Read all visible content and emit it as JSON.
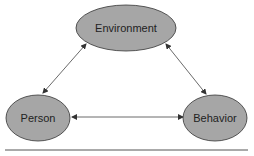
{
  "diagram": {
    "type": "triadic-reciprocal-causation",
    "nodes": [
      {
        "id": "environment",
        "label": "Environment",
        "cx": 126,
        "cy": 28,
        "rx": 50,
        "ry": 23
      },
      {
        "id": "person",
        "label": "Person",
        "cx": 38,
        "cy": 118,
        "rx": 32,
        "ry": 23
      },
      {
        "id": "behavior",
        "label": "Behavior",
        "cx": 215,
        "cy": 118,
        "rx": 32,
        "ry": 23
      }
    ],
    "edges": [
      {
        "from": "person",
        "to": "environment",
        "bidirectional": true
      },
      {
        "from": "environment",
        "to": "behavior",
        "bidirectional": true
      },
      {
        "from": "person",
        "to": "behavior",
        "bidirectional": true
      }
    ],
    "colors": {
      "node_fill": "#a6a6a6",
      "node_stroke": "#333333",
      "edge": "#333333",
      "rule": "#555555"
    }
  }
}
